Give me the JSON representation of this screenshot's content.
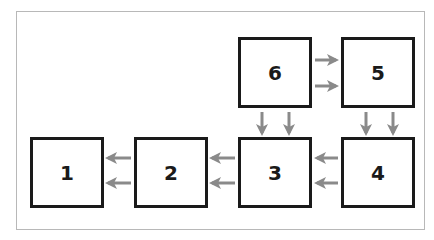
{
  "diagram": {
    "type": "block-flow",
    "colors": {
      "box_border": "#1a1a1a",
      "arrow": "#8a8a8a",
      "frame_border": "#b8b8b8"
    },
    "boxes": [
      {
        "id": "1",
        "label": "1"
      },
      {
        "id": "2",
        "label": "2"
      },
      {
        "id": "3",
        "label": "3"
      },
      {
        "id": "4",
        "label": "4"
      },
      {
        "id": "5",
        "label": "5"
      },
      {
        "id": "6",
        "label": "6"
      }
    ],
    "connections": [
      {
        "from": "6",
        "to": "5",
        "count": 2,
        "direction": "right"
      },
      {
        "from": "6",
        "to": "3",
        "count": 2,
        "direction": "down"
      },
      {
        "from": "5",
        "to": "4",
        "count": 2,
        "direction": "down"
      },
      {
        "from": "4",
        "to": "3",
        "count": 2,
        "direction": "left"
      },
      {
        "from": "3",
        "to": "2",
        "count": 2,
        "direction": "left"
      },
      {
        "from": "2",
        "to": "1",
        "count": 2,
        "direction": "left"
      }
    ]
  }
}
